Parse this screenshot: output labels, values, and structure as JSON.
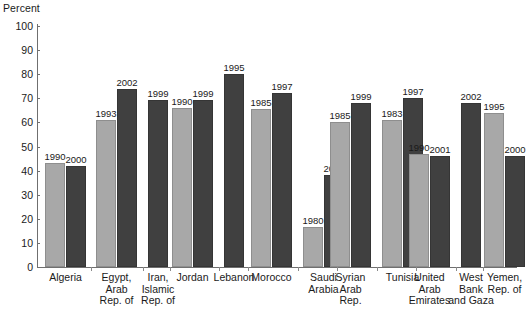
{
  "chart_data": {
    "type": "bar",
    "title": "",
    "subtitle": "",
    "ylabel": "Percent",
    "xlabel": "",
    "ylim": [
      0,
      100
    ],
    "ytick_labels": [
      "100",
      "90",
      "80",
      "70",
      "60",
      "50",
      "40",
      "30",
      "20",
      "10",
      "0"
    ],
    "ytick_values": [
      100,
      90,
      80,
      70,
      60,
      50,
      40,
      30,
      20,
      10,
      0
    ],
    "grid": false,
    "legend_position": "none",
    "bar_value_labels": "year",
    "categories": [
      "Algeria",
      "Egypt,\nArab\nRep. of",
      "Iran,\nIslamic\nRep. of",
      "Jordan",
      "Lebanon",
      "Morocco",
      "Saudi\nArabia",
      "Syrian\nArab\nRep.",
      "Tunisia",
      "United\nArab\nEmirates",
      "West\nBank\nand Gaza",
      "Yemen,\nRep. of"
    ],
    "series_colors": {
      "light": "#a8a8a8",
      "dark": "#404040"
    },
    "groups": [
      {
        "category": "Algeria",
        "bars": [
          {
            "year": "1990",
            "value": 43,
            "shade": "light"
          },
          {
            "year": "2000",
            "value": 42,
            "shade": "dark"
          }
        ]
      },
      {
        "category": "Egypt, Arab Rep. of",
        "bars": [
          {
            "year": "1993",
            "value": 61,
            "shade": "light"
          },
          {
            "year": "2002",
            "value": 74,
            "shade": "dark"
          }
        ]
      },
      {
        "category": "Iran, Islamic Rep. of",
        "bars": [
          {
            "year": "1999",
            "value": 69.5,
            "shade": "dark"
          }
        ]
      },
      {
        "category": "Jordan",
        "bars": [
          {
            "year": "1990",
            "value": 66,
            "shade": "light"
          },
          {
            "year": "1999",
            "value": 69.5,
            "shade": "dark"
          }
        ]
      },
      {
        "category": "Lebanon",
        "bars": [
          {
            "year": "1995",
            "value": 80,
            "shade": "dark"
          }
        ]
      },
      {
        "category": "Morocco",
        "bars": [
          {
            "year": "1985",
            "value": 65.5,
            "shade": "light"
          },
          {
            "year": "1997",
            "value": 72,
            "shade": "dark"
          }
        ]
      },
      {
        "category": "Saudi Arabia",
        "bars": [
          {
            "year": "1980",
            "value": 16.5,
            "shade": "light"
          },
          {
            "year": "2000",
            "value": 38,
            "shade": "dark"
          }
        ]
      },
      {
        "category": "Syrian Arab Rep.",
        "bars": [
          {
            "year": "1985",
            "value": 60,
            "shade": "light"
          },
          {
            "year": "1999",
            "value": 68,
            "shade": "dark"
          }
        ]
      },
      {
        "category": "Tunisia",
        "bars": [
          {
            "year": "1983",
            "value": 61,
            "shade": "light"
          },
          {
            "year": "1997",
            "value": 70,
            "shade": "dark"
          }
        ]
      },
      {
        "category": "United Arab Emirates",
        "bars": [
          {
            "year": "1990",
            "value": 47,
            "shade": "light"
          },
          {
            "year": "2001",
            "value": 46,
            "shade": "dark"
          }
        ]
      },
      {
        "category": "West Bank and Gaza",
        "bars": [
          {
            "year": "2002",
            "value": 68,
            "shade": "dark"
          }
        ]
      },
      {
        "category": "Yemen, Rep. of",
        "bars": [
          {
            "year": "1995",
            "value": 64,
            "shade": "light"
          },
          {
            "year": "2000",
            "value": 46,
            "shade": "dark"
          }
        ]
      }
    ]
  },
  "layout": {
    "plot_left": 37,
    "plot_top": 26,
    "plot_bottom": 267,
    "plot_width": 480,
    "bar_width": 20,
    "group_positions": [
      {
        "x": 43,
        "label_center": 63,
        "sep": 106
      },
      {
        "x": 110,
        "label_center": 131,
        "sep": 155
      },
      {
        "x": 161,
        "label_center": 173,
        "sep": 186
      },
      {
        "x": 190,
        "label_center": 212,
        "sep": 236
      },
      {
        "x": 243,
        "label_center": 255,
        "sep": 269
      },
      {
        "x": 272,
        "label_center": 294,
        "sep": 317
      },
      {
        "x": 324,
        "label_center": 346,
        "sep": 370
      },
      {
        "x": 375,
        "label_center": 397,
        "sep": 421
      },
      {
        "x": 427,
        "label_center": 439,
        "sep": 452
      },
      {
        "x": 456,
        "label_center": 478,
        "sep": 502
      }
    ]
  }
}
